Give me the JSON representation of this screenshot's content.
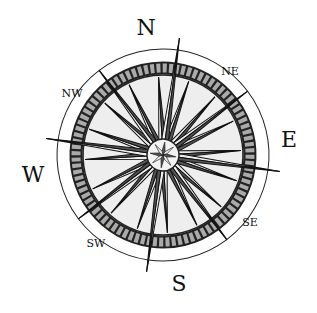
{
  "figure": {
    "type": "compass-rose",
    "rotation_deg": 8,
    "cardinal_labels": {
      "north": "N",
      "east": "E",
      "south": "S",
      "west": "W"
    },
    "intercardinal_labels": {
      "northeast": "NE",
      "southeast": "SE",
      "southwest": "SW",
      "northwest": "NW"
    },
    "colors": {
      "ink": "#111111",
      "dark_fill": "#555555",
      "light_fill": "#eeeeee",
      "ring_fill": "#9a9a9a",
      "background": "#ffffff"
    }
  }
}
